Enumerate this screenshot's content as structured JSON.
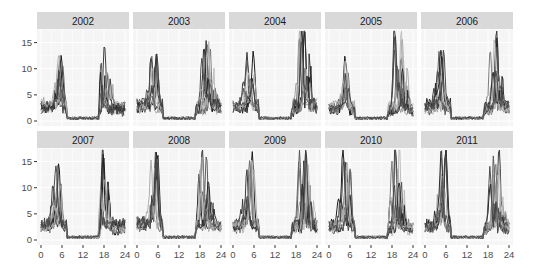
{
  "chart_data": {
    "type": "line",
    "title": "",
    "xlabel": "",
    "ylabel": "",
    "layout": {
      "facet": "wrap",
      "nrow": 2,
      "ncol": 5,
      "grid": true,
      "legend": "none",
      "background": "#ebebeb-free light panel"
    },
    "xlim": [
      0,
      24
    ],
    "ylim": [
      0,
      17
    ],
    "x_ticks": [
      0,
      6,
      12,
      18,
      24
    ],
    "y_ticks": [
      0,
      5,
      10,
      15
    ],
    "strip_labels": [
      "2002",
      "2003",
      "2004",
      "2005",
      "2006",
      "2007",
      "2008",
      "2009",
      "2010",
      "2011"
    ],
    "series_colors": [
      "#111111",
      "#333333",
      "#555555",
      "#777777",
      "#999999",
      "#bbbbbb",
      "#222222",
      "#666666",
      "#aaaaaa",
      "#444444"
    ],
    "panels": [
      {
        "year": "2002",
        "am_peak": 9.8,
        "am_hour": 5.5,
        "pm_peak": 12.2,
        "pm_hour": 17.5,
        "pm_secondary": 9.5
      },
      {
        "year": "2003",
        "am_peak": 10.5,
        "am_hour": 5.0,
        "pm_peak": 12.5,
        "pm_hour": 19.5,
        "pm_secondary": 11.0
      },
      {
        "year": "2004",
        "am_peak": 10.5,
        "am_hour": 5.0,
        "pm_peak": 16.5,
        "pm_hour": 19.5,
        "pm_secondary": 11.5
      },
      {
        "year": "2005",
        "am_peak": 10.5,
        "am_hour": 5.0,
        "pm_peak": 17.0,
        "pm_hour": 19.5,
        "pm_secondary": 12.0
      },
      {
        "year": "2006",
        "am_peak": 10.5,
        "am_hour": 4.5,
        "pm_peak": 15.2,
        "pm_hour": 20.0,
        "pm_secondary": 12.5
      },
      {
        "year": "2007",
        "am_peak": 12.5,
        "am_hour": 4.5,
        "pm_peak": 16.0,
        "pm_hour": 17.0,
        "pm_secondary": 14.0
      },
      {
        "year": "2008",
        "am_peak": 14.0,
        "am_hour": 5.0,
        "pm_peak": 15.5,
        "pm_hour": 19.0,
        "pm_secondary": 14.0
      },
      {
        "year": "2009",
        "am_peak": 14.5,
        "am_hour": 5.0,
        "pm_peak": 14.5,
        "pm_hour": 20.0,
        "pm_secondary": 14.0
      },
      {
        "year": "2010",
        "am_peak": 14.5,
        "am_hour": 5.0,
        "pm_peak": 17.5,
        "pm_hour": 19.0,
        "pm_secondary": 15.0
      },
      {
        "year": "2011",
        "am_peak": 14.0,
        "am_hour": 5.0,
        "pm_peak": 15.5,
        "pm_hour": 20.0,
        "pm_secondary": 14.0
      }
    ],
    "n_series_per_panel": 10
  }
}
